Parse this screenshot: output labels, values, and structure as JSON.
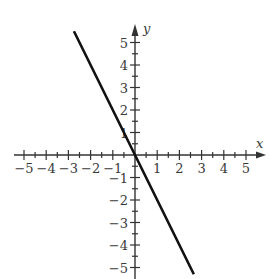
{
  "chart_data": {
    "type": "line",
    "title": "",
    "xlabel": "x",
    "ylabel": "y",
    "xlim": [
      -5,
      5
    ],
    "ylim": [
      -5,
      5
    ],
    "x_ticks": [
      -5,
      -4,
      -3,
      -2,
      -1,
      1,
      2,
      3,
      4,
      5
    ],
    "y_ticks": [
      -5,
      -4,
      -3,
      -2,
      -1,
      1,
      2,
      3,
      4,
      5
    ],
    "x_tick_labels": [
      "−5",
      "−4",
      "−3",
      "−2",
      "−1",
      "1",
      "2",
      "3",
      "4",
      "5"
    ],
    "y_tick_labels": [
      "−5",
      "−4",
      "−3",
      "−2",
      "−1",
      "1",
      "2",
      "3",
      "4",
      "5"
    ],
    "minor_ticks_per_unit": 2,
    "grid": false,
    "legend": null,
    "series": [
      {
        "name": "y = -2x",
        "x": [
          -2.75,
          0,
          2.65
        ],
        "y": [
          5.5,
          0,
          -5.3
        ],
        "color": "#111111"
      }
    ]
  },
  "colors": {
    "axis": "#333333",
    "line": "#111111",
    "text": "#3a3a3a"
  }
}
